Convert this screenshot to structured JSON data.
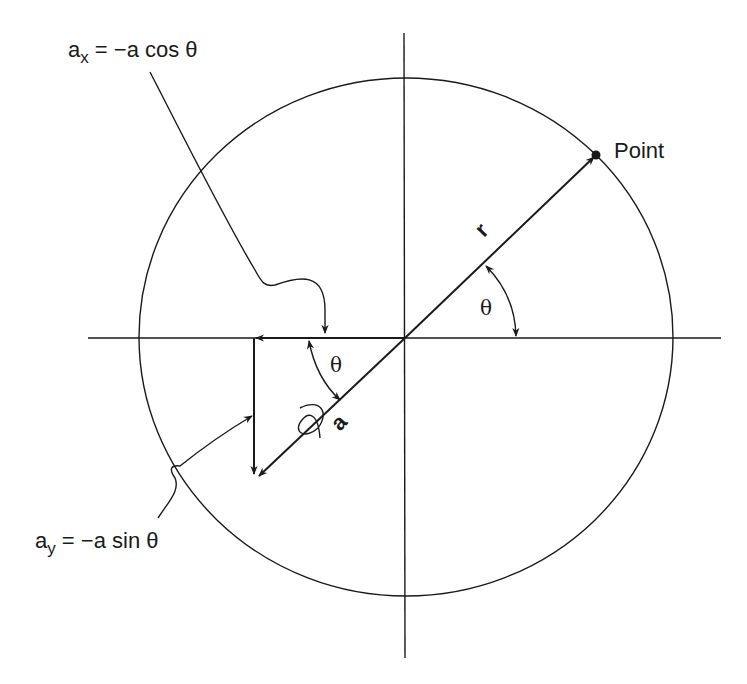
{
  "diagram": {
    "type": "vector-components-on-circle",
    "labels": {
      "ax_label": {
        "base": "a",
        "sub": "x",
        "rest": " = −a cos θ"
      },
      "ay_label": {
        "base": "a",
        "sub": "y",
        "rest": " = −a sin θ"
      },
      "point": "Point",
      "r_vector": "r",
      "a_vector": "a",
      "theta_upper": "θ",
      "theta_lower": "θ"
    },
    "colors": {
      "ink": "#1a1a1a",
      "background": "#ffffff"
    },
    "geometry": {
      "center": [
        405,
        338
      ],
      "circle_rx": 267,
      "circle_ry": 259,
      "angle_deg": 40
    }
  }
}
